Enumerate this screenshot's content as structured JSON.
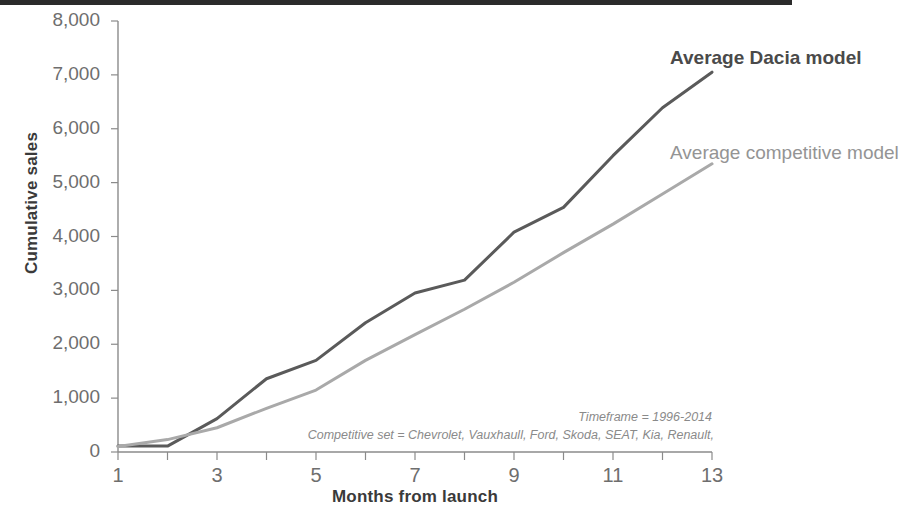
{
  "chart_data": {
    "type": "line",
    "title": "",
    "xlabel": "Months from launch",
    "ylabel": "Cumulative sales",
    "xlim": [
      1,
      13
    ],
    "ylim": [
      0,
      8000
    ],
    "grid": false,
    "legend_position": "right",
    "x": [
      1,
      2,
      3,
      4,
      5,
      6,
      7,
      8,
      9,
      10,
      11,
      12,
      13
    ],
    "x_tick_labels": [
      "1",
      "2",
      "3",
      "4",
      "5",
      "6",
      "7",
      "8",
      "9",
      "10",
      "11",
      "12",
      "13"
    ],
    "x_tick_labels_shown": [
      "1",
      "3",
      "5",
      "7",
      "9",
      "11",
      "13"
    ],
    "y_tick_labels": [
      "0",
      "1,000",
      "2,000",
      "3,000",
      "4,000",
      "5,000",
      "6,000",
      "7,000",
      "8,000"
    ],
    "y_ticks": [
      0,
      1000,
      2000,
      3000,
      4000,
      5000,
      6000,
      7000,
      8000
    ],
    "series": [
      {
        "name": "Average Dacia model",
        "color": "#5a5a5a",
        "width": 3.0,
        "values": [
          110,
          110,
          620,
          1360,
          1700,
          2400,
          2950,
          3190,
          4080,
          4540,
          5500,
          6390,
          7050
        ]
      },
      {
        "name": "Average competitive model",
        "color": "#a9a9a9",
        "width": 3.0,
        "values": [
          100,
          230,
          450,
          810,
          1150,
          1700,
          2180,
          2650,
          3150,
          3700,
          4230,
          4790,
          5350
        ]
      }
    ],
    "annotations": [
      "Timeframe = 1996-2014",
      "Competitive set = Chevrolet, Vauxhaull, Ford, Skoda, SEAT, Kia, Renault,"
    ]
  },
  "axes": {
    "y_title": "Cumulative sales",
    "x_title": "Months from launch"
  },
  "legend": {
    "dacia": "Average Dacia model",
    "competitive": "Average competitive model"
  },
  "annotations": {
    "timeframe": "Timeframe = 1996-2014",
    "competitive_set": "Competitive set = Chevrolet, Vauxhaull, Ford, Skoda, SEAT, Kia, Renault,"
  },
  "colors": {
    "dacia_line": "#5a5a5a",
    "competitive_line": "#a9a9a9",
    "axis": "#8b8b8b",
    "tick_text": "#6e6e6e",
    "title_text": "#3a3a3a",
    "annotation_text": "#8a8a8a"
  }
}
